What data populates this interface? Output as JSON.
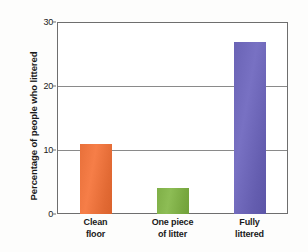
{
  "chart_data": {
    "type": "bar",
    "title": "",
    "subtitle": "",
    "xlabel": "",
    "ylabel": "Percentage of people who littered",
    "categories": [
      "Clean floor",
      "One piece of litter",
      "Fully littered"
    ],
    "category_lines": [
      [
        "Clean",
        "floor"
      ],
      [
        "One piece",
        "of litter"
      ],
      [
        "Fully",
        "littered"
      ]
    ],
    "values": [
      11,
      4,
      26.8
    ],
    "ylim": [
      0,
      30
    ],
    "yticks": [
      0,
      10,
      20,
      30
    ],
    "ytick_labels": [
      "0",
      "10",
      "20",
      "30"
    ],
    "grid": "horizontal",
    "legend": "none",
    "bar_colors": [
      "#E8703A",
      "#7FAF47",
      "#6A63B5"
    ],
    "series": [
      {
        "name": "Percentage of people who littered",
        "values": [
          11,
          4,
          26.8
        ]
      }
    ]
  },
  "style": {
    "background": "#ffffff",
    "axis_color": "#6e6e6e",
    "grid_color": "#8a8a8a",
    "text_color": "#1a1a1a"
  }
}
